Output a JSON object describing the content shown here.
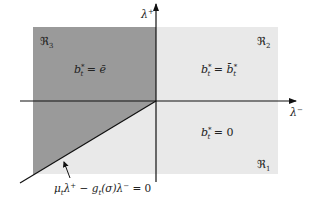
{
  "colors": {
    "background": "#ffffff",
    "region_light": "#e9e9e9",
    "region_dark": "#9a9a9a",
    "axis": "#111111",
    "text": "#222222"
  },
  "axes": {
    "x_label": "λ⁻",
    "y_label": "λ⁺"
  },
  "regions": [
    {
      "id": "R3",
      "label": "ℜ₃",
      "equation": "b*t = ē",
      "shade": "dark"
    },
    {
      "id": "R2",
      "label": "ℜ₂",
      "equation": "b*t = b̄*t",
      "shade": "light"
    },
    {
      "id": "R1",
      "label": "ℜ₁",
      "equation": "b*t = 0",
      "shade": "light"
    }
  ],
  "boundary": {
    "equation": "μtλ⁺ − gt(σ)λ⁻ = 0"
  },
  "text": {
    "r3_label_main": "ℜ",
    "r3_label_sub": "3",
    "r2_label_main": "ℜ",
    "r2_label_sub": "2",
    "r1_label_main": "ℜ",
    "r1_label_sub": "1",
    "r3_eq_lhs": "b",
    "r3_eq_sub": "t",
    "r3_eq_sup": "*",
    "r3_eq_rhs": " = ē",
    "r2_eq_lhs": "b",
    "r2_eq_sub": "t",
    "r2_eq_sup": "*",
    "r2_eq_mid": " = ",
    "r2_eq_rhs": "b̄",
    "r2_eq_rhs_sub": "t",
    "r2_eq_rhs_sup": "*",
    "r1_eq_lhs": "b",
    "r1_eq_sub": "t",
    "r1_eq_sup": "*",
    "r1_eq_rhs": " = 0",
    "x_axis_main": "λ",
    "x_axis_sup": "−",
    "y_axis_main": "λ",
    "y_axis_sup": "+",
    "boundary_mu": "μ",
    "boundary_mu_sub": "t",
    "boundary_lam1": "λ",
    "boundary_lam1_sup": "+",
    "boundary_minus": " − ",
    "boundary_g": "g",
    "boundary_g_sub": "t",
    "boundary_sigma": "(σ)",
    "boundary_lam2": "λ",
    "boundary_lam2_sup": "−",
    "boundary_eq": " = 0"
  }
}
